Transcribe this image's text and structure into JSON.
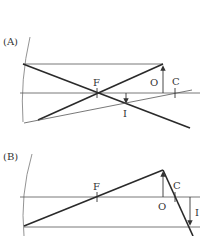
{
  "diagrams": [
    {
      "id": "A",
      "label": "(A)",
      "points": {
        "focal": "F",
        "object": "O",
        "center": "C",
        "image": "I"
      }
    },
    {
      "id": "B",
      "label": "(B)",
      "points": {
        "focal": "F",
        "object": "O",
        "center": "C",
        "image": "I"
      }
    }
  ],
  "colors": {
    "line": "#2a2a2a",
    "thin": "#555555"
  }
}
